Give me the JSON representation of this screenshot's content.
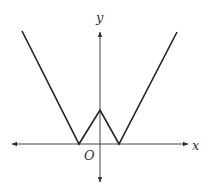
{
  "diagram": {
    "type": "function-graph",
    "axes": {
      "x_label": "x",
      "y_label": "y",
      "origin_label": "O",
      "x_axis": {
        "y": 144,
        "x_start": 12,
        "x_end": 188,
        "arrows": "both"
      },
      "y_axis": {
        "x": 100,
        "y_start": 32,
        "y_end": 182,
        "arrows": "both"
      }
    },
    "curve": {
      "points": "22,31 79,144 100,110 119,144 177,32",
      "shape": "W",
      "vertices": [
        {
          "name": "left-zero",
          "x": 79,
          "y": 144
        },
        {
          "name": "peak-on-y-axis",
          "x": 100,
          "y": 110
        },
        {
          "name": "right-zero",
          "x": 119,
          "y": 144
        }
      ]
    },
    "colors": {
      "curve": "#222222",
      "axes": "#444444",
      "labels": "#333333",
      "background": "#ffffff"
    }
  }
}
